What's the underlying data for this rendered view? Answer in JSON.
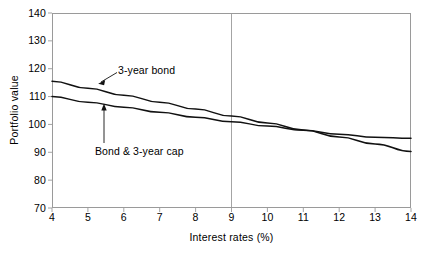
{
  "chart_data": {
    "type": "line",
    "title": "",
    "xlabel": "Interest rates (%)",
    "ylabel": "Portfolio value",
    "xlim": [
      4,
      14
    ],
    "ylim": [
      70,
      140
    ],
    "xticks": [
      4,
      5,
      6,
      7,
      8,
      9,
      10,
      11,
      12,
      13,
      14
    ],
    "yticks": [
      70,
      80,
      90,
      100,
      110,
      120,
      130,
      140
    ],
    "grid": false,
    "legend_position": "inline-annotations",
    "reference_lines": [
      {
        "name": "vertical-reference-9",
        "axis": "x",
        "value": 9
      }
    ],
    "x": [
      4,
      5,
      6,
      7,
      8,
      9,
      10,
      11,
      12,
      13,
      14
    ],
    "series": [
      {
        "name": "3-year bond",
        "values": [
          115.5,
          113.0,
          110.5,
          108.0,
          105.5,
          103.0,
          100.5,
          98.0,
          95.5,
          93.0,
          90.3
        ]
      },
      {
        "name": "Bond & 3-year cap",
        "values": [
          110.0,
          108.0,
          106.2,
          104.4,
          102.6,
          101.0,
          99.4,
          97.9,
          96.5,
          95.4,
          95.0
        ]
      }
    ],
    "annotations": [
      {
        "name": "3-year-bond-label",
        "text": "3-year bond",
        "arrow": "diagonal-down-left"
      },
      {
        "name": "bond-and-cap-label",
        "text": "Bond & 3-year cap",
        "arrow": "vertical-up"
      }
    ],
    "colors": {
      "line": "#111111",
      "frame": "#9a9a9a",
      "reference_line": "#9a9a9a",
      "background": "#ffffff"
    }
  }
}
